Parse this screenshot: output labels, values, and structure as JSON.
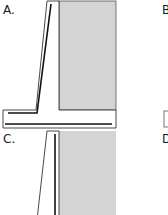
{
  "figure": {
    "panels": [
      {
        "id": "A",
        "label": "A.",
        "type": "cantilever-retaining-wall-with-footing"
      },
      {
        "id": "B",
        "label": "B",
        "type": "clipped"
      },
      {
        "id": "C",
        "label": "C.",
        "type": "retaining-wall-stem"
      },
      {
        "id": "D",
        "label": "D",
        "type": "clipped"
      }
    ],
    "colors": {
      "backfill": "#d4d4d4",
      "outline": "#333333",
      "rebar": "#111111",
      "background": "#ffffff"
    }
  }
}
